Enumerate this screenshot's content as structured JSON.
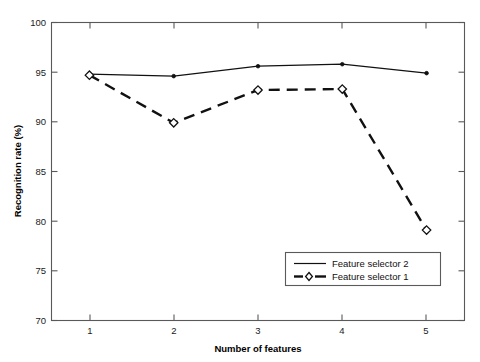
{
  "chart_data": {
    "type": "line",
    "title": "",
    "xlabel": "Number of features",
    "ylabel": "Recognition rate (%)",
    "x": [
      1,
      2,
      3,
      4,
      5
    ],
    "xtick_labels": [
      "1",
      "2",
      "3",
      "4",
      "5"
    ],
    "ytick_labels": [
      "70",
      "75",
      "80",
      "85",
      "90",
      "95",
      "100"
    ],
    "yticks": [
      70,
      75,
      80,
      85,
      90,
      95,
      100
    ],
    "xlim": [
      0.55,
      5.45
    ],
    "ylim": [
      70,
      100
    ],
    "grid": false,
    "legend_position": "lower right",
    "series": [
      {
        "name": "Feature selector 2",
        "style": "solid",
        "marker": "dot",
        "values": [
          94.8,
          94.6,
          95.6,
          95.8,
          94.9
        ]
      },
      {
        "name": "Feature selector 1",
        "style": "dashed",
        "marker": "diamond",
        "values": [
          94.7,
          89.9,
          93.2,
          93.3,
          79.1
        ]
      }
    ]
  },
  "legend": {
    "entries": [
      {
        "label": "Feature selector 2"
      },
      {
        "label": "Feature selector 1"
      }
    ]
  },
  "colors": {
    "line": "#111111",
    "axis": "#595959",
    "background": "#ffffff"
  }
}
